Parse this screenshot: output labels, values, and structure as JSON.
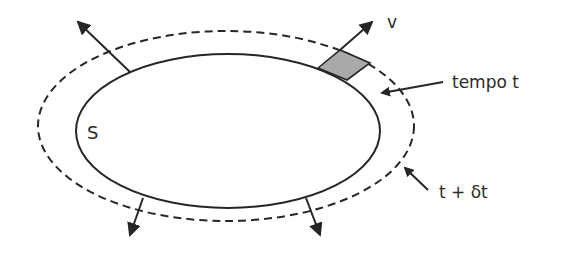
{
  "diagram": {
    "colors": {
      "stroke": "#262626",
      "shaded_element": "#a9a9a9",
      "background": "#ffffff"
    },
    "surface_t": {
      "label": "S",
      "style": "solid",
      "cx": 228,
      "cy": 131,
      "rx": 152,
      "ry": 77
    },
    "surface_t_dt": {
      "style": "dashed",
      "cx": 226,
      "cy": 126,
      "rx": 188,
      "ry": 95
    },
    "velocity_label": "v",
    "labels": {
      "time_t": "tempo t",
      "time_t_dt": "t + δt",
      "surface": "S",
      "velocity": "v"
    },
    "normal_arrows": [
      {
        "from": [
          130,
          72
        ],
        "to": [
          78,
          22
        ]
      },
      {
        "from": [
          340,
          50
        ],
        "to": [
          372,
          22
        ]
      },
      {
        "from": [
          143,
          198
        ],
        "to": [
          130,
          235
        ]
      },
      {
        "from": [
          306,
          198
        ],
        "to": [
          320,
          235
        ]
      }
    ],
    "pointer_arrows": [
      {
        "label": "tempo t",
        "from": [
          443,
          82
        ],
        "to": [
          382,
          93
        ]
      },
      {
        "label": "t + δt",
        "from": [
          428,
          190
        ],
        "to": [
          405,
          168
        ]
      }
    ],
    "shaded_element": {
      "points": [
        [
          318,
          68
        ],
        [
          340,
          50
        ],
        [
          370,
          63
        ],
        [
          347,
          80
        ]
      ]
    }
  }
}
